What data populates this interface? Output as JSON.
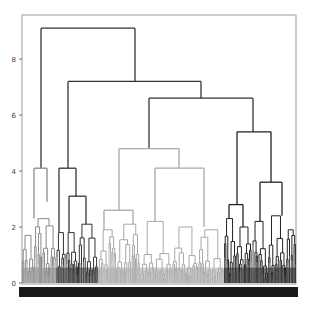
{
  "chart_data": {
    "type": "dendrogram",
    "title": "",
    "xlabel": "",
    "ylabel": "",
    "ylim": [
      0,
      9.2
    ],
    "y_ticks": [
      0,
      2,
      4,
      6,
      8
    ],
    "grid": false,
    "legend": null,
    "root_height": 9.1,
    "clusters": [
      {
        "name": "cluster-1",
        "color": "#8a8a8a",
        "x_range": [
          22,
          56
        ],
        "top_height": 4.0
      },
      {
        "name": "cluster-2",
        "color": "#333333",
        "x_range": [
          56,
          98
        ],
        "top_height": 4.0
      },
      {
        "name": "cluster-3",
        "color": "#a8a8a8",
        "x_range": [
          98,
          224
        ],
        "top_height": 4.8
      },
      {
        "name": "cluster-4",
        "color": "#222222",
        "x_range": [
          224,
          296
        ],
        "top_height": 5.4
      }
    ],
    "merges": [
      {
        "height": 9.1,
        "x1": 41,
        "x2": 135,
        "color": "#333333"
      },
      {
        "height": 7.2,
        "x1": 68,
        "x2": 201,
        "color": "#333333"
      },
      {
        "height": 6.6,
        "x1": 149,
        "x2": 253,
        "color": "#333333"
      },
      {
        "height": 4.8,
        "x1": 119,
        "x2": 179,
        "color": "#a8a8a8"
      },
      {
        "height": 5.4,
        "x1": 237,
        "x2": 271,
        "color": "#222222"
      },
      {
        "height": 4.1,
        "x1": 34,
        "x2": 47,
        "color": "#8a8a8a"
      },
      {
        "height": 4.1,
        "x1": 59,
        "x2": 76,
        "color": "#333333"
      },
      {
        "height": 4.1,
        "x1": 155,
        "x2": 204,
        "color": "#a8a8a8"
      },
      {
        "height": 2.6,
        "x1": 104,
        "x2": 133,
        "color": "#a8a8a8"
      },
      {
        "height": 3.6,
        "x1": 260,
        "x2": 282,
        "color": "#222222"
      },
      {
        "height": 2.8,
        "x1": 229,
        "x2": 243,
        "color": "#222222"
      },
      {
        "height": 3.1,
        "x1": 69,
        "x2": 86,
        "color": "#333333"
      }
    ],
    "color_bar": {
      "color": "#1a1a1a"
    }
  }
}
